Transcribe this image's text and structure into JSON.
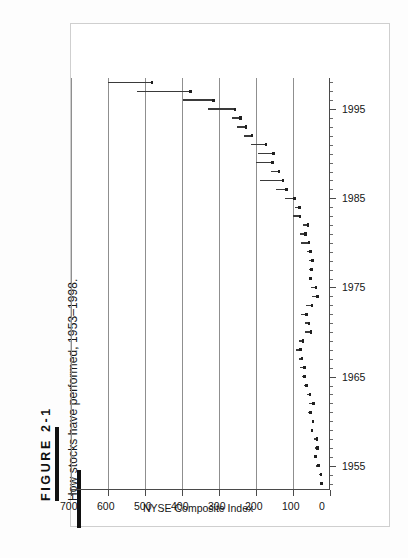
{
  "figure": {
    "label": "FIGURE 2-1",
    "caption": "How stocks have performed, 1953–1998."
  },
  "chart_data": {
    "type": "bar",
    "subtype": "high-low-range",
    "title": "How stocks have performed, 1953–1998.",
    "xlabel": "",
    "ylabel": "NYSE Composite Index",
    "xlim": [
      1952.4,
      1998.6
    ],
    "ylim": [
      0,
      700
    ],
    "grid": "index-axis-only",
    "legend": "none",
    "orientation": "rotated-90-ccw",
    "xticks_major": [
      1955,
      1965,
      1975,
      1985,
      1995
    ],
    "xticks_minor_step": 1,
    "yticks": [
      0,
      100,
      200,
      300,
      400,
      500,
      600,
      700
    ],
    "x": [
      1953,
      1954,
      1955,
      1956,
      1957,
      1958,
      1959,
      1960,
      1961,
      1962,
      1963,
      1964,
      1965,
      1966,
      1967,
      1968,
      1969,
      1970,
      1971,
      1972,
      1973,
      1974,
      1975,
      1976,
      1977,
      1978,
      1979,
      1980,
      1981,
      1982,
      1983,
      1984,
      1985,
      1986,
      1987,
      1988,
      1989,
      1990,
      1991,
      1992,
      1993,
      1994,
      1995,
      1996,
      1997,
      1998
    ],
    "series": [
      {
        "name": "NYSE Composite Index annual low",
        "values": [
          21.5,
          22.7,
          29.0,
          37.5,
          32.0,
          33.5,
          47.0,
          45.0,
          52.0,
          43.0,
          53.0,
          62.5,
          68.0,
          67.0,
          74.0,
          79.0,
          72.0,
          50.0,
          55.0,
          62.5,
          47.0,
          32.0,
          36.0,
          51.0,
          49.0,
          45.5,
          51.5,
          55.5,
          65.0,
          58.5,
          79.5,
          81.5,
          94.5,
          117.0,
          125.5,
          136.0,
          154.0,
          151.0,
          171.5,
          209.0,
          226.0,
          240.0,
          255.0,
          313.0,
          375.0,
          480.0
        ]
      },
      {
        "name": "NYSE Composite Index annual high",
        "values": [
          24.0,
          30.0,
          37.0,
          42.0,
          40.0,
          43.0,
          52.0,
          50.0,
          60.0,
          56.0,
          63.0,
          70.0,
          77.0,
          80.0,
          85.0,
          91.0,
          85.0,
          68.0,
          68.0,
          78.0,
          66.0,
          50.0,
          52.0,
          58.0,
          56.5,
          56.5,
          63.5,
          79.0,
          80.0,
          72.5,
          100.0,
          94.0,
          122.0,
          146.0,
          188.0,
          160.0,
          201.0,
          194.0,
          214.0,
          232.0,
          251.0,
          266.0,
          330.0,
          396.0,
          521.0,
          601.0
        ]
      }
    ]
  }
}
